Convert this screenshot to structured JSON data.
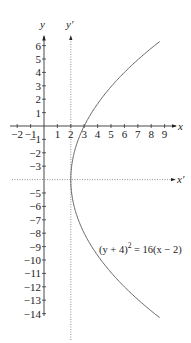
{
  "figure": {
    "type": "parabola_translation_diagram",
    "axes": {
      "x_label": "x",
      "y_label": "y",
      "x_prime_label": "x'",
      "y_prime_label": "y'"
    },
    "x_ticks": [
      "−2",
      "−1",
      "1",
      "2",
      "3",
      "4",
      "5",
      "6",
      "7",
      "8",
      "9"
    ],
    "y_ticks_positive": [
      "6",
      "5",
      "4",
      "3",
      "2",
      "1"
    ],
    "y_ticks_negative": [
      "−1",
      "−2",
      "−3",
      "−5",
      "−6",
      "−7",
      "−8",
      "−9",
      "−10",
      "−11",
      "−12",
      "−13",
      "−14"
    ],
    "equation": {
      "lhs": "(y + 4)",
      "exp": "2",
      "rhs": " = 16(x − 2)"
    },
    "vertex": [
      2,
      -4
    ],
    "colors": {
      "axis": "#333333",
      "curve": "#555555",
      "dotted": "#777777"
    }
  }
}
